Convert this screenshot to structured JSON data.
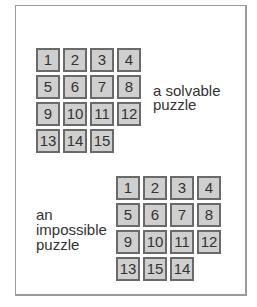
{
  "solvable": {
    "label_line1": "a solvable",
    "label_line2": "puzzle",
    "tiles": [
      {
        "n": "1",
        "r": 0,
        "c": 0
      },
      {
        "n": "2",
        "r": 0,
        "c": 1
      },
      {
        "n": "3",
        "r": 0,
        "c": 2
      },
      {
        "n": "4",
        "r": 0,
        "c": 3
      },
      {
        "n": "5",
        "r": 1,
        "c": 0
      },
      {
        "n": "6",
        "r": 1,
        "c": 1
      },
      {
        "n": "7",
        "r": 1,
        "c": 2
      },
      {
        "n": "8",
        "r": 1,
        "c": 3
      },
      {
        "n": "9",
        "r": 2,
        "c": 0
      },
      {
        "n": "10",
        "r": 2,
        "c": 1
      },
      {
        "n": "11",
        "r": 2,
        "c": 2
      },
      {
        "n": "12",
        "r": 2,
        "c": 3
      },
      {
        "n": "13",
        "r": 3,
        "c": 0
      },
      {
        "n": "14",
        "r": 3,
        "c": 1
      },
      {
        "n": "15",
        "r": 3,
        "c": 2
      }
    ]
  },
  "impossible": {
    "label_line1": "an",
    "label_line2": "impossible",
    "label_line3": "puzzle",
    "tiles": [
      {
        "n": "1",
        "r": 0,
        "c": 0
      },
      {
        "n": "2",
        "r": 0,
        "c": 1
      },
      {
        "n": "3",
        "r": 0,
        "c": 2
      },
      {
        "n": "4",
        "r": 0,
        "c": 3
      },
      {
        "n": "5",
        "r": 1,
        "c": 0
      },
      {
        "n": "6",
        "r": 1,
        "c": 1
      },
      {
        "n": "7",
        "r": 1,
        "c": 2
      },
      {
        "n": "8",
        "r": 1,
        "c": 3
      },
      {
        "n": "9",
        "r": 2,
        "c": 0
      },
      {
        "n": "10",
        "r": 2,
        "c": 1
      },
      {
        "n": "11",
        "r": 2,
        "c": 2
      },
      {
        "n": "12",
        "r": 2,
        "c": 3
      },
      {
        "n": "13",
        "r": 3,
        "c": 0
      },
      {
        "n": "15",
        "r": 3,
        "c": 1
      },
      {
        "n": "14",
        "r": 3,
        "c": 2
      }
    ]
  }
}
